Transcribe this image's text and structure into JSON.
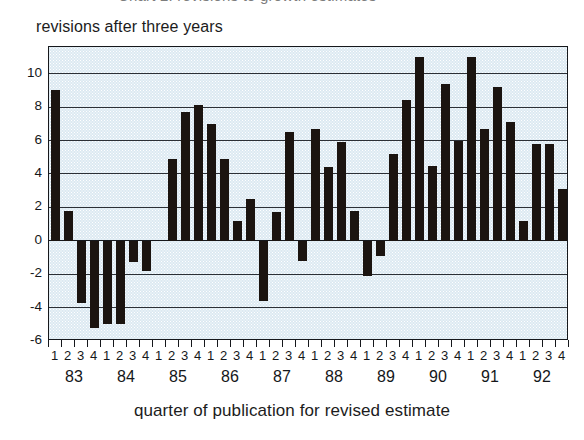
{
  "top_cropped_caption": "Chart 2: revisions to growth estimates",
  "title": "revisions after three years",
  "x_caption": "quarter of publication for revised estimate",
  "axis": {
    "y_ticks": [
      10,
      8,
      6,
      4,
      2,
      0,
      -2,
      -4,
      -6
    ],
    "y_min": -6,
    "y_max": 11.6,
    "quarter_labels": [
      "1",
      "2",
      "3",
      "4"
    ],
    "year_labels": [
      "83",
      "84",
      "85",
      "86",
      "87",
      "88",
      "89",
      "90",
      "91",
      "92"
    ]
  },
  "colors": {
    "bar": "#1b1410",
    "plot_background": "#dce9f2",
    "gridline": "#2b2f35",
    "border": "#16181c",
    "text": "#15171a"
  },
  "chart_data": {
    "type": "bar",
    "title": "revisions after three years",
    "xlabel": "quarter of publication for revised estimate",
    "ylabel": "",
    "ylim": [
      -6,
      11.6
    ],
    "grid": true,
    "legend": null,
    "categories": [
      "83Q1",
      "83Q2",
      "83Q3",
      "83Q4",
      "84Q1",
      "84Q2",
      "84Q3",
      "84Q4",
      "85Q1",
      "85Q2",
      "85Q3",
      "85Q4",
      "86Q1",
      "86Q2",
      "86Q3",
      "86Q4",
      "87Q1",
      "87Q2",
      "87Q3",
      "87Q4",
      "88Q1",
      "88Q2",
      "88Q3",
      "88Q4",
      "89Q1",
      "89Q2",
      "89Q3",
      "89Q4",
      "90Q1",
      "90Q2",
      "90Q3",
      "90Q4",
      "91Q1",
      "91Q2",
      "91Q3",
      "91Q4",
      "92Q1",
      "92Q2",
      "92Q3",
      "92Q4"
    ],
    "values": [
      9.0,
      1.8,
      -3.7,
      -5.2,
      -5.0,
      -5.0,
      -1.3,
      -1.8,
      0.0,
      4.9,
      7.7,
      8.1,
      7.0,
      4.9,
      1.2,
      2.5,
      -3.6,
      1.7,
      6.5,
      -1.2,
      6.7,
      4.4,
      5.9,
      1.8,
      -2.1,
      -0.9,
      5.2,
      8.4,
      11.0,
      4.5,
      9.4,
      6.0,
      11.0,
      6.7,
      9.2,
      7.1,
      1.2,
      5.8,
      5.8,
      3.1
    ]
  }
}
